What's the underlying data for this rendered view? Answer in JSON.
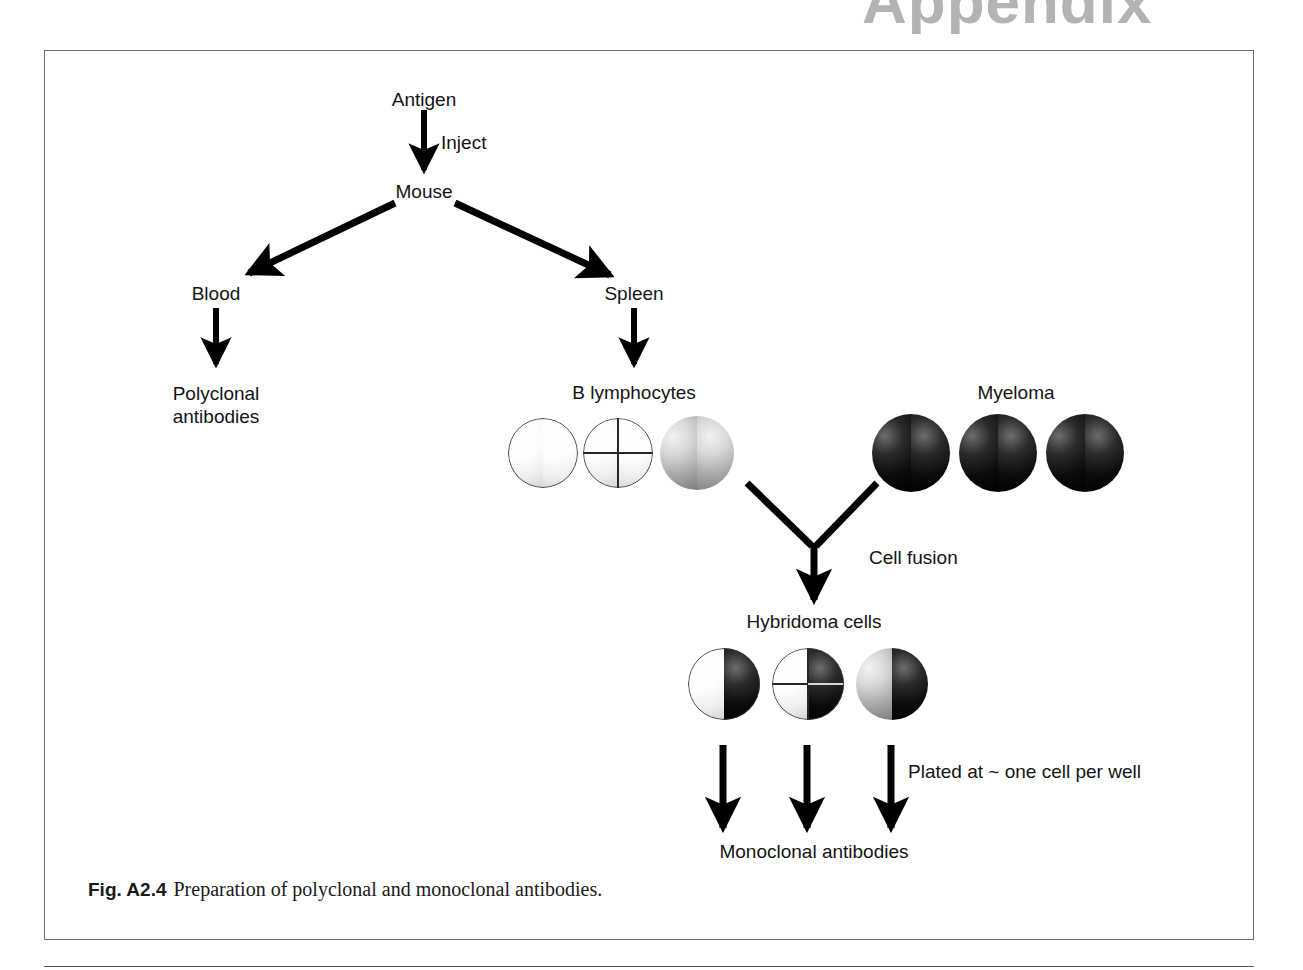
{
  "page": {
    "header_word": "Appendix"
  },
  "figure": {
    "caption_label": "Fig. A2.4",
    "caption_text": "Preparation of polyclonal and monoclonal antibodies."
  },
  "diagram": {
    "title": "Preparation of polyclonal and monoclonal antibodies",
    "colors": {
      "line": "#000000",
      "text": "#141414",
      "frame": "#6e6e6e",
      "header_gray": "#b3b3b3",
      "cell_light": "#ffffff",
      "cell_gray": "#a9a9a9",
      "cell_dark": "#000000"
    },
    "nodes": {
      "antigen": "Antigen",
      "inject": "Inject",
      "mouse": "Mouse",
      "blood": "Blood",
      "spleen": "Spleen",
      "polyclonal_line1": "Polyclonal",
      "polyclonal_line2": "antibodies",
      "b_lymphocytes": "B lymphocytes",
      "myeloma": "Myeloma",
      "cell_fusion": "Cell fusion",
      "hybridoma": "Hybridoma cells",
      "plated": "Plated at ~ one cell per well",
      "monoclonal": "Monoclonal antibodies"
    },
    "cells": {
      "b_lymphocytes": [
        {
          "name": "b-cell-plain",
          "style": "white"
        },
        {
          "name": "b-cell-quadrant",
          "style": "white-cross"
        },
        {
          "name": "b-cell-gray",
          "style": "gray"
        }
      ],
      "myeloma": [
        {
          "name": "myeloma-cell-1",
          "style": "black"
        },
        {
          "name": "myeloma-cell-2",
          "style": "black"
        },
        {
          "name": "myeloma-cell-3",
          "style": "black"
        }
      ],
      "hybridoma": [
        {
          "name": "hybridoma-cell-plain",
          "style": "white-black"
        },
        {
          "name": "hybridoma-cell-quadrant",
          "style": "white-cross-black"
        },
        {
          "name": "hybridoma-cell-gray",
          "style": "gray-black"
        }
      ]
    }
  }
}
